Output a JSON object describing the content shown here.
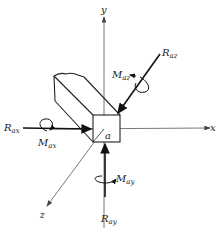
{
  "diagram": {
    "axes": {
      "x": "x",
      "y": "y",
      "z": "z"
    },
    "point_label": "a",
    "forces": [
      {
        "id": "R_ax",
        "symbol": "R",
        "subscript": "ax"
      },
      {
        "id": "R_ay",
        "symbol": "R",
        "subscript": "ay"
      },
      {
        "id": "R_az",
        "symbol": "R",
        "subscript": "az"
      }
    ],
    "moments": [
      {
        "id": "M_ax",
        "symbol": "M",
        "subscript": "ax"
      },
      {
        "id": "M_ay",
        "symbol": "M",
        "subscript": "ay"
      },
      {
        "id": "M_az",
        "symbol": "M",
        "subscript": "az"
      }
    ],
    "colors": {
      "stroke": "#222222",
      "axis": "#555555",
      "background": "#ffffff"
    }
  }
}
